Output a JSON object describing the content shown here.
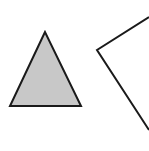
{
  "diagram": {
    "background": "#ffffff",
    "shapes": [
      {
        "id": "triangle",
        "kind": "filled-triangle",
        "points": "45,32 10,106 81,106",
        "fill": "#c8c8c8",
        "stroke": "#1a1a1a",
        "stroke_width": 2
      },
      {
        "id": "angle-shape",
        "kind": "open-polyline",
        "points": "149,17 97,50 149,130",
        "fill": "none",
        "stroke": "#1a1a1a",
        "stroke_width": 2
      }
    ]
  }
}
